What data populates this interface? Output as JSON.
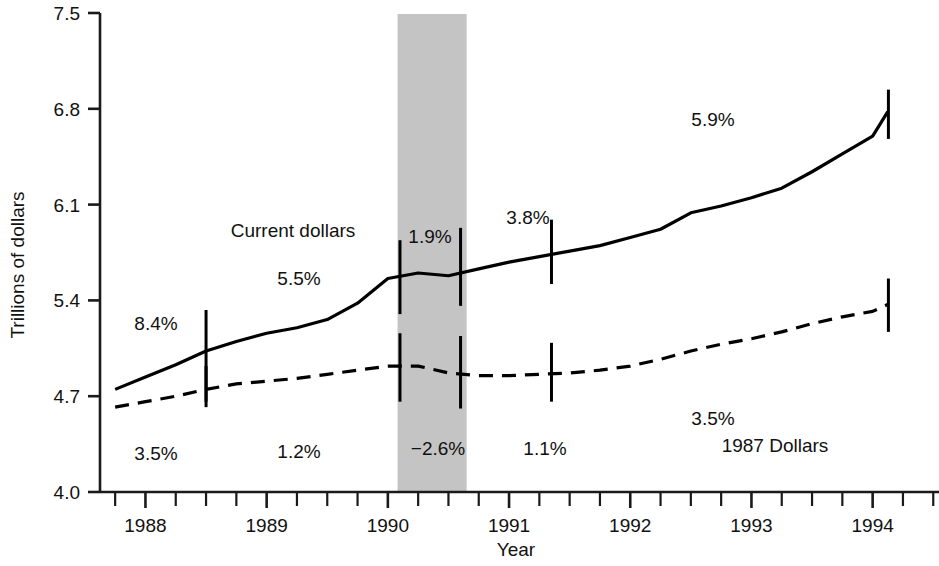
{
  "chart_data": {
    "type": "line",
    "title": "",
    "xlabel": "Year",
    "ylabel": "Trillions of dollars",
    "ylim": [
      4.0,
      7.5
    ],
    "ytick_labels": [
      "4.0",
      "4.7",
      "5.4",
      "6.1",
      "6.8",
      "7.5"
    ],
    "ytick_values": [
      4.0,
      4.7,
      5.4,
      6.1,
      6.8,
      7.5
    ],
    "xtick_labels": [
      "1988",
      "1989",
      "1990",
      "1991",
      "1992",
      "1993",
      "1994"
    ],
    "xtick_values": [
      1988,
      1989,
      1990,
      1991,
      1992,
      1993,
      1994
    ],
    "xlim": [
      1987.625,
      1994.5
    ],
    "grid": false,
    "legend": "inline-labels",
    "minor_ticks": "quarterly",
    "series": [
      {
        "name": "Current dollars",
        "style": "solid",
        "color": "#000000",
        "x": [
          1987.75,
          1988.0,
          1988.25,
          1988.5,
          1988.75,
          1989.0,
          1989.25,
          1989.5,
          1989.75,
          1990.0,
          1990.25,
          1990.5,
          1990.75,
          1991.0,
          1991.25,
          1991.5,
          1991.75,
          1992.0,
          1992.25,
          1992.5,
          1992.75,
          1993.0,
          1993.25,
          1993.5,
          1993.75,
          1994.0,
          1994.125
        ],
        "y": [
          4.75,
          4.84,
          4.93,
          5.03,
          5.1,
          5.16,
          5.2,
          5.26,
          5.38,
          5.56,
          5.6,
          5.58,
          5.63,
          5.68,
          5.72,
          5.76,
          5.8,
          5.86,
          5.92,
          6.04,
          6.09,
          6.15,
          6.22,
          6.34,
          6.47,
          6.6,
          6.78
        ]
      },
      {
        "name": "1987 Dollars",
        "style": "dashed",
        "color": "#000000",
        "x": [
          1987.75,
          1988.0,
          1988.25,
          1988.5,
          1988.75,
          1989.0,
          1989.25,
          1989.5,
          1989.75,
          1990.0,
          1990.25,
          1990.5,
          1990.75,
          1991.0,
          1991.25,
          1991.5,
          1991.75,
          1992.0,
          1992.25,
          1992.5,
          1992.75,
          1993.0,
          1993.25,
          1993.5,
          1993.75,
          1994.0,
          1994.125
        ],
        "y": [
          4.62,
          4.66,
          4.7,
          4.75,
          4.79,
          4.81,
          4.83,
          4.86,
          4.89,
          4.92,
          4.92,
          4.87,
          4.85,
          4.85,
          4.86,
          4.87,
          4.89,
          4.92,
          4.97,
          5.03,
          5.08,
          5.12,
          5.17,
          5.23,
          5.28,
          5.32,
          5.37
        ]
      }
    ],
    "error_bars": [
      {
        "x": 1988.5,
        "series": "Current dollars",
        "center": 5.03,
        "low": 4.66,
        "high": 5.33
      },
      {
        "x": 1990.1,
        "series": "Current dollars",
        "center": 5.57,
        "low": 5.3,
        "high": 5.84
      },
      {
        "x": 1990.6,
        "series": "Current dollars",
        "center": 5.62,
        "low": 5.36,
        "high": 5.93
      },
      {
        "x": 1991.35,
        "series": "Current dollars",
        "center": 5.74,
        "low": 5.52,
        "high": 5.99
      },
      {
        "x": 1994.13,
        "series": "Current dollars",
        "center": 6.78,
        "low": 6.58,
        "high": 6.94
      },
      {
        "x": 1988.5,
        "series": "1987 Dollars",
        "center": 4.75,
        "low": 4.62,
        "high": 4.92
      },
      {
        "x": 1990.1,
        "series": "1987 Dollars",
        "center": 4.92,
        "low": 4.66,
        "high": 5.16
      },
      {
        "x": 1990.6,
        "series": "1987 Dollars",
        "center": 4.87,
        "low": 4.61,
        "high": 5.14
      },
      {
        "x": 1991.35,
        "series": "1987 Dollars",
        "center": 4.86,
        "low": 4.66,
        "high": 5.09
      },
      {
        "x": 1994.13,
        "series": "1987 Dollars",
        "center": 5.37,
        "low": 5.17,
        "high": 5.56
      }
    ],
    "shaded_region": {
      "label": "recession-band",
      "x_start": 1990.08,
      "x_end": 1990.65,
      "color": "#c4c4c4"
    },
    "annotations": [
      {
        "text": "8.4%",
        "x": 156,
        "y": 330,
        "name": "growth-label-8-4"
      },
      {
        "text": "3.5%",
        "x": 156,
        "y": 460,
        "name": "growth-label-3-5-left"
      },
      {
        "text": "Current dollars",
        "x": 293,
        "y": 237,
        "name": "series-label-current-dollars"
      },
      {
        "text": "5.5%",
        "x": 299,
        "y": 285,
        "name": "growth-label-5-5"
      },
      {
        "text": "1.2%",
        "x": 299,
        "y": 458,
        "name": "growth-label-1-2"
      },
      {
        "text": "1.9%",
        "x": 430,
        "y": 243,
        "name": "growth-label-1-9"
      },
      {
        "text": "−2.6%",
        "x": 438,
        "y": 455,
        "name": "growth-label-minus-2-6"
      },
      {
        "text": "3.8%",
        "x": 528,
        "y": 224,
        "name": "growth-label-3-8"
      },
      {
        "text": "1.1%",
        "x": 545,
        "y": 455,
        "name": "growth-label-1-1"
      },
      {
        "text": "5.9%",
        "x": 713,
        "y": 126,
        "name": "growth-label-5-9"
      },
      {
        "text": "3.5%",
        "x": 713,
        "y": 425,
        "name": "growth-label-3-5-right"
      },
      {
        "text": "1987 Dollars",
        "x": 775,
        "y": 452,
        "name": "series-label-1987-dollars"
      }
    ]
  },
  "geometry": {
    "axis_x": 100,
    "axis_top_y": 13,
    "axis_bottom_y": 492,
    "plot_right_x": 930,
    "x_origin_year": 1987.625,
    "px_per_year": 121.2,
    "y_top_value": 7.5,
    "y_bottom_value": 4.0
  }
}
